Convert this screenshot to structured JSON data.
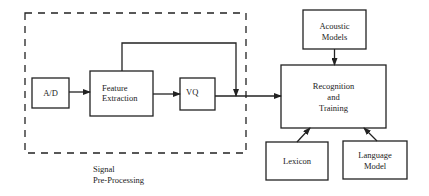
{
  "diagram": {
    "type": "block-diagram",
    "nodes": {
      "ad": {
        "label": "A/D"
      },
      "feature_extraction": {
        "line1": "Feature",
        "line2": "Extraction"
      },
      "vq": {
        "label": "VQ"
      },
      "acoustic_models": {
        "line1": "Acoustic",
        "line2": "Models"
      },
      "recognition_training": {
        "line1": "Recognition",
        "line2": "and",
        "line3": "Training"
      },
      "lexicon": {
        "label": "Lexicon"
      },
      "language_model": {
        "line1": "Language",
        "line2": "Model"
      }
    },
    "group": {
      "name": "signal-preprocessing",
      "line1": "Signal",
      "line2": "Pre-Processing",
      "contains": [
        "A/D",
        "Feature Extraction",
        "VQ"
      ]
    },
    "edges": [
      {
        "from": "A/D",
        "to": "Feature Extraction"
      },
      {
        "from": "Feature Extraction",
        "to": "VQ"
      },
      {
        "from": "Feature Extraction",
        "to": "VQ output line (bypass)"
      },
      {
        "from": "VQ",
        "to": "Recognition and Training"
      },
      {
        "from": "Acoustic Models",
        "to": "Recognition and Training"
      },
      {
        "from": "Lexicon",
        "to": "Recognition and Training"
      },
      {
        "from": "Language Model",
        "to": "Recognition and Training"
      }
    ],
    "colors": {
      "stroke": "#222222",
      "background": "#ffffff"
    }
  }
}
